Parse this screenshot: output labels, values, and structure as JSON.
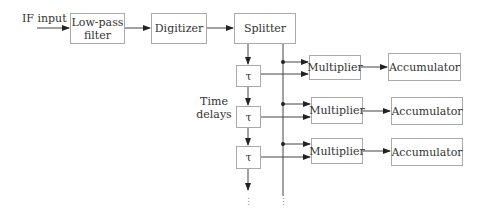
{
  "diagram": {
    "input_label": "IF input",
    "blocks": {
      "lowpass": "Low-pass filter",
      "digitizer": "Digitizer",
      "splitter": "Splitter"
    },
    "delay_symbol": "τ",
    "delay_label": "Time delays",
    "rows": [
      {
        "multiplier": "Multiplier",
        "accumulator": "Accumulator"
      },
      {
        "multiplier": "Multiplier",
        "accumulator": "Accumulator"
      },
      {
        "multiplier": "Multiplier",
        "accumulator": "Accumulator"
      }
    ],
    "continuation": "⋮"
  }
}
